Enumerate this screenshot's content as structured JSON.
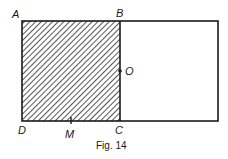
{
  "figure": {
    "caption": "Fig. 14",
    "labels": {
      "A": "A",
      "B": "B",
      "C": "C",
      "D": "D",
      "O": "O",
      "M": "M"
    },
    "shapes": {
      "outer_rectangle": {
        "x": 22,
        "y": 21,
        "width": 196,
        "height": 100
      },
      "square_ABCD": {
        "x": 22,
        "y": 21,
        "width": 98,
        "height": 100,
        "fill": "hatched"
      },
      "point_O": {
        "x": 120,
        "y": 71
      },
      "point_M": {
        "x": 71,
        "y": 121
      }
    },
    "colors": {
      "stroke": "#1a1a1a",
      "hatch": "#2a2a2a",
      "background": "#ffffff"
    }
  }
}
